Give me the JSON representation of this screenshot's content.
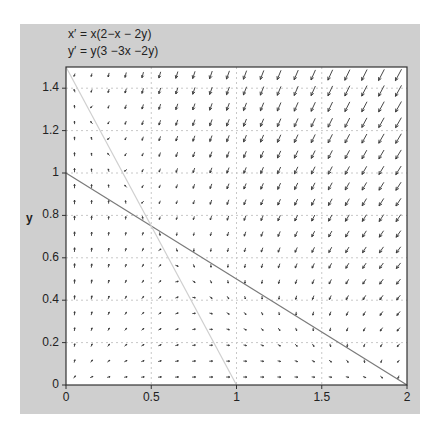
{
  "chart_data": {
    "type": "vector_field",
    "title": "",
    "equations": [
      "x′ = x(2−x − 2y)",
      "y′ = y(3 −3x −2y)"
    ],
    "system": {
      "dx": {
        "form": "x*(a - b*x - c*y)",
        "a": 2,
        "b": 1,
        "c": 2
      },
      "dy": {
        "form": "y*(a - b*x - c*y)",
        "a": 3,
        "b": 3,
        "c": 2
      }
    },
    "xlabel": "",
    "ylabel": "y",
    "xlim": [
      0,
      2
    ],
    "ylim": [
      0,
      1.5
    ],
    "xticks": [
      0,
      0.5,
      1,
      1.5,
      2
    ],
    "xtick_labels": [
      "0",
      "0.5",
      "1",
      "1.5",
      "2"
    ],
    "yticks": [
      0,
      0.2,
      0.4,
      0.6,
      0.8,
      1,
      1.2,
      1.4
    ],
    "ytick_labels": [
      "0",
      "0.2",
      "0.4",
      "0.6",
      "0.8",
      "1",
      "1.2",
      "1.4"
    ],
    "grid": {
      "on": true,
      "style": "dotted",
      "x": [
        0.5,
        1,
        1.5
      ],
      "y": [
        0.2,
        0.4,
        0.6,
        0.8,
        1,
        1.2,
        1.4
      ]
    },
    "arrow_grid": {
      "nx": 20,
      "ny": 20
    },
    "nullclines": [
      {
        "name": "x-nullcline",
        "equation": "x + 2y = 2",
        "from": [
          0,
          1
        ],
        "to": [
          2,
          0
        ],
        "color": "#7a7a7a"
      },
      {
        "name": "y-nullcline",
        "equation": "3x + 2y = 3",
        "from": [
          0,
          1.5
        ],
        "to": [
          1,
          0
        ],
        "color": "#cfcfcf"
      }
    ],
    "colors": {
      "panel": "#cfcfcf",
      "plot_bg": "#ffffff",
      "arrow": "#333333",
      "grid": "#c8c8c8",
      "axis": "#333333"
    }
  },
  "labels": {
    "eq1": "x′  = x(2−x − 2y)",
    "eq2": "y′  = y(3 −3x −2y)",
    "ylabel": "y"
  }
}
